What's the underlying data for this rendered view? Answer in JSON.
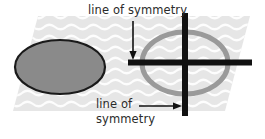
{
  "figure": {
    "labels": {
      "top": "line of symmetry",
      "bottom_line1": "line of",
      "bottom_line2": "symmetry"
    },
    "colors": {
      "background": "#ffffff",
      "plane_fill": "#e6e6e6",
      "plane_wave": "#fdfdfd",
      "solid_ellipse_fill": "#8a8a8a",
      "solid_ellipse_stroke": "#1a1a1a",
      "ring_ellipse_stroke": "#9a9a9a",
      "symmetry_line": "#111111",
      "arrow": "#111111",
      "text": "#2b2b2b"
    },
    "shapes": {
      "solid_ellipse": {
        "name": "filled gray ellipse",
        "cx": 60,
        "cy": 67,
        "rx": 45,
        "ry": 27
      },
      "ring_ellipse": {
        "name": "gray outline ellipse",
        "cx": 185,
        "cy": 63,
        "rx": 43,
        "ry": 31,
        "stroke_width": 5
      },
      "vertical_symmetry_line": {
        "x": 185,
        "y1": 13,
        "y2": 116,
        "width": 6
      },
      "horizontal_symmetry_line": {
        "y": 62,
        "x1": 128,
        "x2": 252,
        "width": 6
      },
      "plane": {
        "name": "slanted plane",
        "points": "38,16 250,16 225,111 13,111"
      }
    },
    "arrows": {
      "top": {
        "name": "down arrow to horizontal line",
        "x1": 133,
        "y1": 22,
        "x2": 133,
        "y2": 59
      },
      "bottom": {
        "name": "right arrow to vertical line",
        "x1": 139,
        "y1": 106,
        "x2": 181,
        "y2": 106
      }
    }
  }
}
